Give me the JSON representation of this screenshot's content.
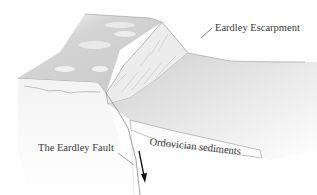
{
  "diagram": {
    "labels": {
      "escarpment": "Eardley Escarpment",
      "fault": "The Eardley Fault",
      "sediments": "Ordovician sediments"
    },
    "icons": {
      "fault_arrow": "down-arrow"
    },
    "colors": {
      "background": "#ffffff",
      "plateau": "#d6d6d6",
      "escarpment_face": "#e9e9e9",
      "lowland": "#dcdcdc",
      "lines": "#8a8a8a",
      "arrow": "#111111",
      "text": "#3a3a3a"
    }
  }
}
